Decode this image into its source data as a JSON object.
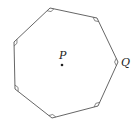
{
  "figure": {
    "shape": "heptagon",
    "vertices": [
      [
        50,
        8
      ],
      [
        97,
        18
      ],
      [
        118,
        62
      ],
      [
        98,
        106
      ],
      [
        52,
        118
      ],
      [
        15,
        89
      ],
      [
        14,
        42
      ]
    ],
    "center_point": {
      "label": "P",
      "x": 62,
      "y": 65
    },
    "vertex_label": {
      "label": "Q",
      "vertex_index": 2
    },
    "angle_markers": "at every vertex",
    "stroke_color": "#555555"
  },
  "labels": {
    "center": "P",
    "vertex": "Q"
  }
}
